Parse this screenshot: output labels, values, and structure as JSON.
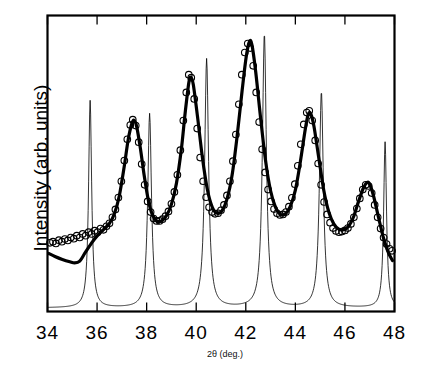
{
  "chart_data": {
    "type": "line",
    "title": "",
    "xlabel": "2θ (deg.)",
    "ylabel": "Intensity (arb. units)",
    "xlim": [
      34,
      48
    ],
    "ylim": [
      0,
      1
    ],
    "xticks": [
      34,
      36,
      38,
      40,
      42,
      44,
      46,
      48
    ],
    "xticklabels": [
      "34",
      "36",
      "38",
      "40",
      "42",
      "44",
      "46",
      "48"
    ],
    "yticks": [],
    "yticklabels": [],
    "grid": false,
    "legend": null,
    "tick_direction": "in",
    "frame": "box",
    "series": [
      {
        "name": "observed",
        "style": "open-circle-markers",
        "marker": "o",
        "color": "#000000",
        "points": [
          [
            34.1,
            0.232
          ],
          [
            34.22,
            0.236
          ],
          [
            34.34,
            0.23
          ],
          [
            34.46,
            0.241
          ],
          [
            34.58,
            0.236
          ],
          [
            34.7,
            0.245
          ],
          [
            34.82,
            0.24
          ],
          [
            34.94,
            0.25
          ],
          [
            35.06,
            0.246
          ],
          [
            35.18,
            0.256
          ],
          [
            35.3,
            0.25
          ],
          [
            35.42,
            0.262
          ],
          [
            35.54,
            0.256
          ],
          [
            35.66,
            0.268
          ],
          [
            35.78,
            0.262
          ],
          [
            35.9,
            0.273
          ],
          [
            36.02,
            0.268
          ],
          [
            36.14,
            0.28
          ],
          [
            36.26,
            0.276
          ],
          [
            36.38,
            0.288
          ],
          [
            36.5,
            0.298
          ],
          [
            36.62,
            0.318
          ],
          [
            36.74,
            0.345
          ],
          [
            36.86,
            0.385
          ],
          [
            36.98,
            0.44
          ],
          [
            37.1,
            0.51
          ],
          [
            37.22,
            0.582
          ],
          [
            37.34,
            0.63
          ],
          [
            37.44,
            0.648
          ],
          [
            37.56,
            0.628
          ],
          [
            37.68,
            0.572
          ],
          [
            37.8,
            0.498
          ],
          [
            37.92,
            0.428
          ],
          [
            38.04,
            0.372
          ],
          [
            38.16,
            0.336
          ],
          [
            38.28,
            0.314
          ],
          [
            38.4,
            0.306
          ],
          [
            38.52,
            0.306
          ],
          [
            38.64,
            0.312
          ],
          [
            38.76,
            0.322
          ],
          [
            38.88,
            0.338
          ],
          [
            39.0,
            0.364
          ],
          [
            39.12,
            0.404
          ],
          [
            39.24,
            0.462
          ],
          [
            39.36,
            0.545
          ],
          [
            39.48,
            0.645
          ],
          [
            39.6,
            0.74
          ],
          [
            39.7,
            0.8
          ],
          [
            39.8,
            0.79
          ],
          [
            39.92,
            0.718
          ],
          [
            40.04,
            0.618
          ],
          [
            40.16,
            0.52
          ],
          [
            40.28,
            0.44
          ],
          [
            40.4,
            0.386
          ],
          [
            40.52,
            0.352
          ],
          [
            40.64,
            0.336
          ],
          [
            40.76,
            0.33
          ],
          [
            40.88,
            0.332
          ],
          [
            41.0,
            0.342
          ],
          [
            41.12,
            0.36
          ],
          [
            41.24,
            0.392
          ],
          [
            41.36,
            0.44
          ],
          [
            41.48,
            0.508
          ],
          [
            41.6,
            0.598
          ],
          [
            41.72,
            0.7
          ],
          [
            41.84,
            0.8
          ],
          [
            41.96,
            0.875
          ],
          [
            42.08,
            0.905
          ],
          [
            42.18,
            0.89
          ],
          [
            42.3,
            0.83
          ],
          [
            42.42,
            0.74
          ],
          [
            42.54,
            0.64
          ],
          [
            42.66,
            0.548
          ],
          [
            42.78,
            0.47
          ],
          [
            42.9,
            0.412
          ],
          [
            43.02,
            0.372
          ],
          [
            43.14,
            0.346
          ],
          [
            43.26,
            0.332
          ],
          [
            43.38,
            0.326
          ],
          [
            43.5,
            0.328
          ],
          [
            43.62,
            0.336
          ],
          [
            43.74,
            0.354
          ],
          [
            43.86,
            0.384
          ],
          [
            43.98,
            0.43
          ],
          [
            44.1,
            0.492
          ],
          [
            44.22,
            0.565
          ],
          [
            44.34,
            0.632
          ],
          [
            44.46,
            0.672
          ],
          [
            44.56,
            0.678
          ],
          [
            44.68,
            0.645
          ],
          [
            44.8,
            0.578
          ],
          [
            44.92,
            0.5
          ],
          [
            45.04,
            0.428
          ],
          [
            45.16,
            0.37
          ],
          [
            45.28,
            0.328
          ],
          [
            45.4,
            0.3
          ],
          [
            45.52,
            0.282
          ],
          [
            45.64,
            0.272
          ],
          [
            45.76,
            0.268
          ],
          [
            45.88,
            0.27
          ],
          [
            46.0,
            0.274
          ],
          [
            46.12,
            0.282
          ],
          [
            46.24,
            0.296
          ],
          [
            46.36,
            0.318
          ],
          [
            46.48,
            0.348
          ],
          [
            46.6,
            0.382
          ],
          [
            46.72,
            0.412
          ],
          [
            46.84,
            0.428
          ],
          [
            46.96,
            0.424
          ],
          [
            47.08,
            0.4
          ],
          [
            47.2,
            0.36
          ],
          [
            47.32,
            0.318
          ],
          [
            47.44,
            0.28
          ],
          [
            47.56,
            0.25
          ],
          [
            47.68,
            0.228
          ],
          [
            47.8,
            0.212
          ],
          [
            47.9,
            0.205
          ]
        ]
      },
      {
        "name": "calculated-fit",
        "style": "thick-line",
        "color": "#000000",
        "linewidth": 3.2,
        "points": [
          [
            34.05,
            0.196
          ],
          [
            34.3,
            0.186
          ],
          [
            34.6,
            0.176
          ],
          [
            34.9,
            0.168
          ],
          [
            35.1,
            0.164
          ],
          [
            35.3,
            0.17
          ],
          [
            35.5,
            0.196
          ],
          [
            35.7,
            0.222
          ],
          [
            35.9,
            0.245
          ],
          [
            36.1,
            0.264
          ],
          [
            36.3,
            0.28
          ],
          [
            36.5,
            0.298
          ],
          [
            36.7,
            0.33
          ],
          [
            36.9,
            0.392
          ],
          [
            37.1,
            0.492
          ],
          [
            37.25,
            0.578
          ],
          [
            37.4,
            0.634
          ],
          [
            37.5,
            0.646
          ],
          [
            37.6,
            0.624
          ],
          [
            37.75,
            0.55
          ],
          [
            37.9,
            0.46
          ],
          [
            38.05,
            0.384
          ],
          [
            38.2,
            0.334
          ],
          [
            38.4,
            0.306
          ],
          [
            38.6,
            0.306
          ],
          [
            38.8,
            0.324
          ],
          [
            39.0,
            0.362
          ],
          [
            39.2,
            0.432
          ],
          [
            39.4,
            0.548
          ],
          [
            39.55,
            0.668
          ],
          [
            39.7,
            0.772
          ],
          [
            39.78,
            0.792
          ],
          [
            39.88,
            0.768
          ],
          [
            40.05,
            0.66
          ],
          [
            40.25,
            0.52
          ],
          [
            40.45,
            0.412
          ],
          [
            40.65,
            0.352
          ],
          [
            40.85,
            0.332
          ],
          [
            41.05,
            0.342
          ],
          [
            41.25,
            0.382
          ],
          [
            41.45,
            0.462
          ],
          [
            41.65,
            0.592
          ],
          [
            41.85,
            0.745
          ],
          [
            42.02,
            0.862
          ],
          [
            42.15,
            0.912
          ],
          [
            42.25,
            0.9
          ],
          [
            42.4,
            0.81
          ],
          [
            42.6,
            0.652
          ],
          [
            42.8,
            0.508
          ],
          [
            43.0,
            0.408
          ],
          [
            43.2,
            0.352
          ],
          [
            43.4,
            0.328
          ],
          [
            43.6,
            0.33
          ],
          [
            43.8,
            0.356
          ],
          [
            44.0,
            0.41
          ],
          [
            44.2,
            0.505
          ],
          [
            44.4,
            0.616
          ],
          [
            44.52,
            0.666
          ],
          [
            44.62,
            0.668
          ],
          [
            44.75,
            0.626
          ],
          [
            44.95,
            0.516
          ],
          [
            45.15,
            0.408
          ],
          [
            45.35,
            0.336
          ],
          [
            45.55,
            0.296
          ],
          [
            45.75,
            0.278
          ],
          [
            45.95,
            0.276
          ],
          [
            46.15,
            0.288
          ],
          [
            46.35,
            0.32
          ],
          [
            46.55,
            0.372
          ],
          [
            46.75,
            0.418
          ],
          [
            46.9,
            0.436
          ],
          [
            47.0,
            0.43
          ],
          [
            47.15,
            0.392
          ],
          [
            47.35,
            0.32
          ],
          [
            47.55,
            0.25
          ],
          [
            47.75,
            0.2
          ],
          [
            47.92,
            0.172
          ]
        ]
      },
      {
        "name": "reference-peaks",
        "style": "thin-line",
        "color": "#000000",
        "linewidth": 0.8,
        "baseline": 0.012,
        "peaks": [
          {
            "center": 35.72,
            "height": 0.7,
            "width": 0.075
          },
          {
            "center": 38.12,
            "height": 0.655,
            "width": 0.09
          },
          {
            "center": 40.42,
            "height": 0.84,
            "width": 0.095
          },
          {
            "center": 42.75,
            "height": 0.925,
            "width": 0.095
          },
          {
            "center": 45.05,
            "height": 0.73,
            "width": 0.095
          },
          {
            "center": 47.62,
            "height": 0.56,
            "width": 0.07
          }
        ]
      }
    ]
  }
}
